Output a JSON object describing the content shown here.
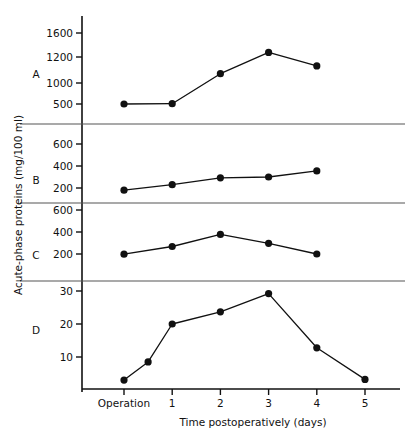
{
  "figure": {
    "y_axis_title": "Acute-phase proteins (mg/100 ml)",
    "x_axis_title": "Time postoperatively (days)",
    "x_tick_labels": [
      "Operation",
      "1",
      "2",
      "3",
      "4",
      "5"
    ]
  },
  "panels": [
    {
      "letter": "A",
      "y_ticks": [
        "1600",
        "1200",
        "1000",
        "500"
      ],
      "points": [
        {
          "x_label": "Operation",
          "value": 500
        },
        {
          "x_label": "1",
          "value": 505
        },
        {
          "x_label": "2",
          "value": 970
        },
        {
          "x_label": "3",
          "value": 1300
        },
        {
          "x_label": "4",
          "value": 1090
        }
      ]
    },
    {
      "letter": "B",
      "y_ticks": [
        "600",
        "400",
        "200"
      ],
      "points": [
        {
          "x_label": "Operation",
          "value": 180
        },
        {
          "x_label": "1",
          "value": 230
        },
        {
          "x_label": "2",
          "value": 293
        },
        {
          "x_label": "3",
          "value": 300
        },
        {
          "x_label": "4",
          "value": 355
        }
      ]
    },
    {
      "letter": "C",
      "y_ticks": [
        "600",
        "400",
        "200"
      ],
      "points": [
        {
          "x_label": "Operation",
          "value": 198
        },
        {
          "x_label": "1",
          "value": 268
        },
        {
          "x_label": "2",
          "value": 378
        },
        {
          "x_label": "3",
          "value": 297
        },
        {
          "x_label": "4",
          "value": 200
        }
      ]
    },
    {
      "letter": "D",
      "y_ticks": [
        "30",
        "20",
        "10"
      ],
      "points": [
        {
          "x_label": "Operation",
          "value": 3
        },
        {
          "x_label": "0.5",
          "value": 8.5
        },
        {
          "x_label": "1",
          "value": 20
        },
        {
          "x_label": "2",
          "value": 23.7
        },
        {
          "x_label": "3",
          "value": 29.2
        },
        {
          "x_label": "4",
          "value": 12.8
        },
        {
          "x_label": "5",
          "value": 3.2
        }
      ]
    }
  ],
  "chart_data": {
    "type": "line",
    "title": "",
    "xlabel": "Time postoperatively (days)",
    "ylabel": "Acute-phase proteins (mg/100 ml)",
    "x": [
      "Operation",
      "1",
      "2",
      "3",
      "4",
      "5"
    ],
    "grid": false,
    "legend": "none",
    "panels": [
      {
        "name": "A",
        "ytick_values": [
          1600,
          1200,
          1000,
          500
        ],
        "ylim": [
          250,
          1750
        ],
        "x": [
          "Operation",
          "1",
          "2",
          "3",
          "4"
        ],
        "values": [
          500,
          505,
          970,
          1300,
          1090
        ]
      },
      {
        "name": "B",
        "ytick_values": [
          600,
          400,
          200
        ],
        "ylim": [
          60,
          660
        ],
        "x": [
          "Operation",
          "1",
          "2",
          "3",
          "4"
        ],
        "values": [
          180,
          230,
          293,
          300,
          355
        ]
      },
      {
        "name": "C",
        "ytick_values": [
          600,
          400,
          200
        ],
        "ylim": [
          60,
          660
        ],
        "x": [
          "Operation",
          "1",
          "2",
          "3",
          "4"
        ],
        "values": [
          198,
          268,
          378,
          297,
          200
        ]
      },
      {
        "name": "D",
        "ytick_values": [
          30,
          20,
          10
        ],
        "ylim": [
          0,
          33
        ],
        "x": [
          "Operation",
          "0.5",
          "1",
          "2",
          "3",
          "4",
          "5"
        ],
        "values": [
          3,
          8.5,
          20,
          23.7,
          29.2,
          12.8,
          3.2
        ]
      }
    ]
  }
}
